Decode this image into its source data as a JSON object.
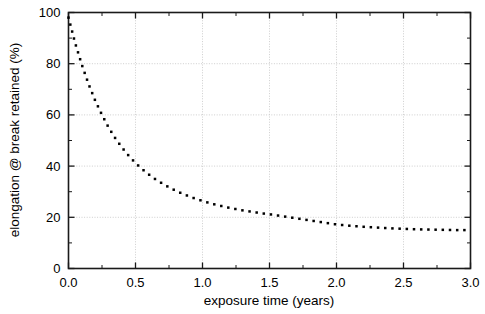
{
  "chart_data": {
    "type": "line",
    "title": "",
    "xlabel": "exposure time (years)",
    "ylabel": "elongation @ break retained (%)",
    "xlim": [
      0.0,
      3.0
    ],
    "ylim": [
      0,
      100
    ],
    "grid": true,
    "legend": "none",
    "line_style": "dotted",
    "marker": "square-dot",
    "color": "#000000",
    "xticks": [
      0.0,
      0.5,
      1.0,
      1.5,
      2.0,
      2.5,
      3.0
    ],
    "xtick_labels": [
      "0.0",
      "0.5",
      "1.0",
      "1.5",
      "2.0",
      "2.5",
      "3.0"
    ],
    "x_minor_ticks": [
      0.25,
      0.75,
      1.25,
      1.75,
      2.25,
      2.75
    ],
    "yticks": [
      0,
      20,
      40,
      60,
      80,
      100
    ],
    "ytick_labels": [
      "0",
      "20",
      "40",
      "60",
      "80",
      "100"
    ],
    "y_minor_ticks": [
      10,
      30,
      50,
      70,
      90
    ],
    "x": [
      0.0,
      0.05,
      0.1,
      0.15,
      0.2,
      0.25,
      0.3,
      0.35,
      0.4,
      0.45,
      0.5,
      0.55,
      0.6,
      0.65,
      0.7,
      0.75,
      0.8,
      0.85,
      0.9,
      0.95,
      1.0,
      1.05,
      1.1,
      1.15,
      1.2,
      1.25,
      1.3,
      1.35,
      1.4,
      1.45,
      1.5,
      1.55,
      1.6,
      1.65,
      1.7,
      1.75,
      1.8,
      1.85,
      1.9,
      1.95,
      2.0,
      2.1,
      2.2,
      2.3,
      2.4,
      2.5,
      2.6,
      2.7,
      2.8,
      2.9,
      3.0
    ],
    "y": [
      98.0,
      88.0,
      79.5,
      72.0,
      65.5,
      60.0,
      55.0,
      50.8,
      47.2,
      44.0,
      41.2,
      38.8,
      36.7,
      34.8,
      33.2,
      31.7,
      30.4,
      29.2,
      28.2,
      27.2,
      26.4,
      25.6,
      24.9,
      24.3,
      23.7,
      23.2,
      22.7,
      22.3,
      21.9,
      21.5,
      21.2,
      20.8,
      20.4,
      20.0,
      19.6,
      19.2,
      18.8,
      18.4,
      18.0,
      17.6,
      17.2,
      16.7,
      16.3,
      16.0,
      15.7,
      15.5,
      15.3,
      15.2,
      15.1,
      15.0,
      15.0
    ],
    "series": [
      {
        "name": "elongation @ break retained",
        "values": [
          98.0,
          88.0,
          79.5,
          72.0,
          65.5,
          60.0,
          55.0,
          50.8,
          47.2,
          44.0,
          41.2,
          38.8,
          36.7,
          34.8,
          33.2,
          31.7,
          30.4,
          29.2,
          28.2,
          27.2,
          26.4,
          25.6,
          24.9,
          24.3,
          23.7,
          23.2,
          22.7,
          22.3,
          21.9,
          21.5,
          21.2,
          20.8,
          20.4,
          20.0,
          19.6,
          19.2,
          18.8,
          18.4,
          18.0,
          17.6,
          17.2,
          16.7,
          16.3,
          16.0,
          15.7,
          15.5,
          15.3,
          15.2,
          15.1,
          15.0,
          15.0
        ]
      }
    ]
  },
  "colors": {
    "axis": "#1a1a1a",
    "grid": "#c8c8c8",
    "data": "#000000",
    "background": "#ffffff"
  }
}
